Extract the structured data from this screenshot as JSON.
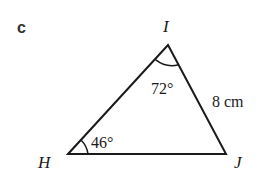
{
  "part_label": "c",
  "triangle": {
    "vertices": {
      "H": {
        "label": "H"
      },
      "I": {
        "label": "I"
      },
      "J": {
        "label": "J"
      }
    },
    "angles": {
      "I": "72°",
      "H": "46°"
    },
    "sides": {
      "IJ": "8 cm"
    }
  },
  "colors": {
    "line": "#1a1a1a",
    "text": "#1a1a1a",
    "part_label": "#333333"
  }
}
